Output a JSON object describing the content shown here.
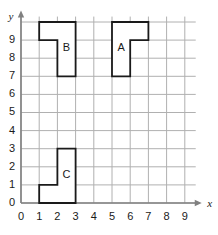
{
  "chart_data": {
    "type": "scatter",
    "title": "",
    "xlabel": "x",
    "ylabel": "y",
    "xlim": [
      0,
      9.6
    ],
    "ylim": [
      0,
      10.3
    ],
    "grid": true,
    "legend": null,
    "x_ticks": [
      "0",
      "1",
      "2",
      "3",
      "4",
      "5",
      "6",
      "7",
      "8",
      "9"
    ],
    "y_ticks": [
      "0",
      "1",
      "2",
      "3",
      "4",
      "5",
      "6",
      "7",
      "8",
      "9"
    ],
    "x_tick_values": [
      0,
      1,
      2,
      3,
      4,
      5,
      6,
      7,
      8,
      9
    ],
    "y_tick_values": [
      0,
      1,
      2,
      3,
      4,
      5,
      6,
      7,
      8,
      9
    ],
    "colors": {
      "grid": "#b0b0b0",
      "axis": "#808080",
      "shape_outline": "#1a1a1a",
      "shape_fill": "#ffffff",
      "text": "#1a1a1a",
      "background": "#ffffff"
    },
    "shapes": [
      {
        "label": "B",
        "label_position": [
          2.5,
          8.55
        ],
        "vertices": [
          [
            1,
            10
          ],
          [
            3,
            10
          ],
          [
            3,
            7
          ],
          [
            2,
            7
          ],
          [
            2,
            9
          ],
          [
            1,
            9
          ]
        ],
        "area_units": 4
      },
      {
        "label": "A",
        "label_position": [
          5.5,
          8.55
        ],
        "vertices": [
          [
            5,
            10
          ],
          [
            7,
            10
          ],
          [
            7,
            9
          ],
          [
            6,
            9
          ],
          [
            6,
            7
          ],
          [
            5,
            7
          ]
        ],
        "area_units": 4
      },
      {
        "label": "C",
        "label_position": [
          2.5,
          1.55
        ],
        "vertices": [
          [
            1,
            1
          ],
          [
            2,
            1
          ],
          [
            2,
            3
          ],
          [
            3,
            3
          ],
          [
            3,
            0
          ],
          [
            1,
            0
          ]
        ],
        "area_units": 4
      }
    ]
  },
  "axes": {
    "x_axis_name": "x",
    "y_axis_name": "y",
    "origin_label": "0"
  }
}
